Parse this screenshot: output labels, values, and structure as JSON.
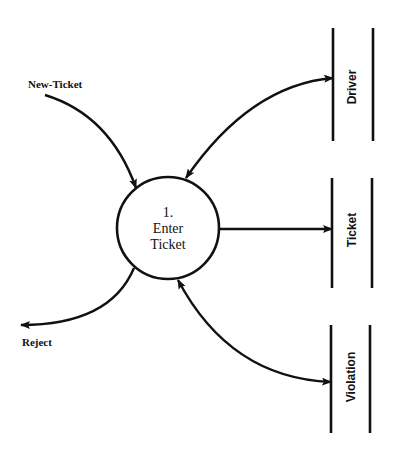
{
  "diagram": {
    "type": "data-flow-diagram",
    "process": {
      "number": "1.",
      "line1": "Enter",
      "line2": "Ticket"
    },
    "external_flows": {
      "input": {
        "label": "New-Ticket",
        "direction": "in"
      },
      "output": {
        "label": "Reject",
        "direction": "out"
      }
    },
    "data_stores": [
      {
        "label": "Driver",
        "flow": "bidirectional"
      },
      {
        "label": "Ticket",
        "flow": "out"
      },
      {
        "label": "Violation",
        "flow": "bidirectional"
      }
    ],
    "colors": {
      "ink": "#111111",
      "background": "#ffffff"
    }
  }
}
